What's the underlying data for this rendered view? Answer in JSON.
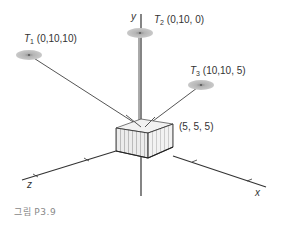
{
  "figure": {
    "caption": "그림 P3.9",
    "axes": {
      "x_label": "x",
      "y_label": "y",
      "z_label": "z"
    },
    "box": {
      "label": "(5, 5, 5)"
    },
    "targets": [
      {
        "name": "T",
        "index": "1",
        "coords": "(0,10,10)"
      },
      {
        "name": "T",
        "index": "2",
        "coords": "(0,10, 0)"
      },
      {
        "name": "T",
        "index": "3",
        "coords": "(10,10, 5)"
      }
    ],
    "colors": {
      "line": "#333333",
      "target_fill": "#aaaaaa",
      "box_face": "#e6e6e6"
    }
  }
}
